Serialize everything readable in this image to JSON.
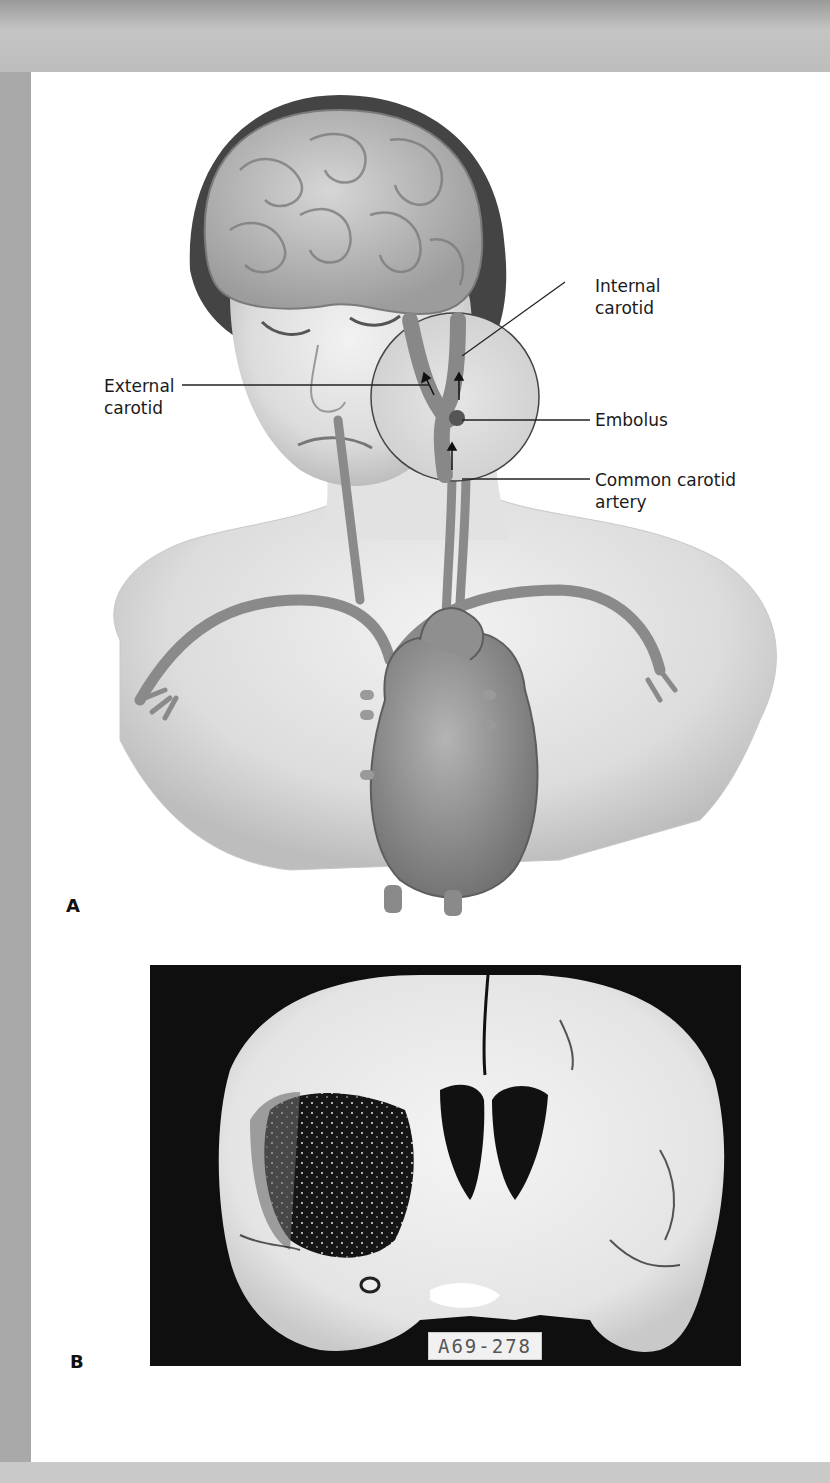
{
  "figure": {
    "panel_a": {
      "letter": "A",
      "labels": {
        "internal_carotid_line1": "Internal",
        "internal_carotid_line2": "carotid",
        "external_carotid_line1": "External",
        "external_carotid_line2": "carotid",
        "embolus": "Embolus",
        "common_carotid_line1": "Common carotid",
        "common_carotid_line2": "artery"
      }
    },
    "panel_b": {
      "letter": "B",
      "specimen_label": "A69-278"
    }
  },
  "colors": {
    "frame_gray": "#b8b8b8",
    "page_white": "#ffffff",
    "photo_background": "#0f0f0f",
    "vessel_gray": "#8a8a8a"
  }
}
